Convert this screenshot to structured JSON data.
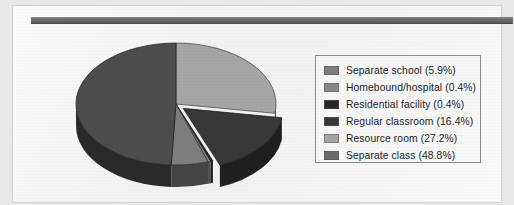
{
  "figure": {
    "background_color": "#f3f3f3",
    "page_border_color": "#bebebe",
    "top_rule_color": "#6f6f6f"
  },
  "legend": {
    "border_color": "#8d8d8d",
    "position": "right",
    "entries": [
      {
        "label": "Separate school (5.9%)",
        "name": "Separate school",
        "value": 5.9,
        "color": "#7e7e7e"
      },
      {
        "label": "Homebound/hospital (0.4%)",
        "name": "Homebound/hospital",
        "value": 0.4,
        "color": "#898989"
      },
      {
        "label": "Residential facility (0.4%)",
        "name": "Residential facility",
        "value": 0.4,
        "color": "#262626"
      },
      {
        "label": "Regular classroom (16.4%)",
        "name": "Regular classroom",
        "value": 16.4,
        "color": "#383838"
      },
      {
        "label": "Resource room (27.2%)",
        "name": "Resource room",
        "value": 27.2,
        "color": "#a6a6a6"
      },
      {
        "label": "Separate class (48.8%)",
        "name": "Separate class",
        "value": 48.8,
        "color": "#6b6b6b"
      }
    ]
  },
  "chart_data": {
    "type": "pie",
    "title": "",
    "subtitle": "",
    "xlabel": "",
    "ylabel": "",
    "grid": false,
    "legend_position": "right",
    "three_d": true,
    "units": "percent",
    "total": 100.1,
    "start_angle_deg": 0,
    "direction": "clockwise",
    "categories": [
      "Resource room",
      "Regular classroom",
      "Residential facility",
      "Homebound/hospital",
      "Separate school",
      "Separate class"
    ],
    "values": [
      27.2,
      16.4,
      0.4,
      0.4,
      5.9,
      48.8
    ],
    "slice_colors": [
      "#a6a6a6",
      "#383838",
      "#262626",
      "#898989",
      "#7e7e7e",
      "#4d4d4d"
    ],
    "slices": [
      {
        "label": "Resource room (27.2%)",
        "name": "Resource room",
        "value": 27.2,
        "color": "#a6a6a6",
        "exploded": false
      },
      {
        "label": "Regular classroom (16.4%)",
        "name": "Regular classroom",
        "value": 16.4,
        "color": "#383838",
        "exploded": true
      },
      {
        "label": "Residential facility (0.4%)",
        "name": "Residential facility",
        "value": 0.4,
        "color": "#262626",
        "exploded": false
      },
      {
        "label": "Homebound/hospital (0.4%)",
        "name": "Homebound/hospital",
        "value": 0.4,
        "color": "#898989",
        "exploded": false
      },
      {
        "label": "Separate school (5.9%)",
        "name": "Separate school",
        "value": 5.9,
        "color": "#7e7e7e",
        "exploded": false
      },
      {
        "label": "Separate class (48.8%)",
        "name": "Separate class",
        "value": 48.8,
        "color": "#4d4d4d",
        "exploded": false
      }
    ],
    "geometry": {
      "center_x": 163,
      "center_y": 98,
      "radius_x": 100,
      "radius_y": 61,
      "depth": 22
    }
  }
}
